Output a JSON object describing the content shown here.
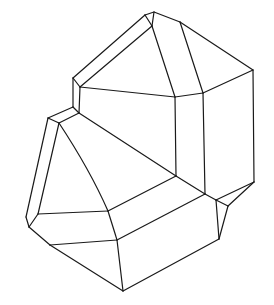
{
  "figure": {
    "title": "",
    "stroke_color": "#1a1a1a",
    "background": "#ffffff",
    "edges": [
      [
        145,
        15,
        154,
        12
      ],
      [
        154,
        12,
        180,
        22
      ],
      [
        180,
        22,
        253,
        70
      ],
      [
        145,
        15,
        73,
        78
      ],
      [
        152,
        26,
        80,
        87
      ],
      [
        145,
        15,
        152,
        26
      ],
      [
        154,
        12,
        152,
        26
      ],
      [
        73,
        78,
        80,
        87
      ],
      [
        80,
        87,
        175,
        97
      ],
      [
        152,
        26,
        175,
        97
      ],
      [
        180,
        22,
        203,
        93
      ],
      [
        175,
        97,
        203,
        93
      ],
      [
        203,
        93,
        253,
        70
      ],
      [
        73,
        78,
        73,
        107
      ],
      [
        80,
        87,
        79,
        113
      ],
      [
        73,
        107,
        79,
        113
      ],
      [
        175,
        97,
        176,
        176
      ],
      [
        203,
        93,
        205,
        194
      ],
      [
        253,
        70,
        254,
        182
      ],
      [
        73,
        107,
        48,
        118
      ],
      [
        79,
        113,
        59,
        123
      ],
      [
        48,
        118,
        59,
        123
      ],
      [
        79,
        113,
        176,
        176
      ],
      [
        176,
        176,
        205,
        194
      ],
      [
        205,
        194,
        216,
        200
      ],
      [
        216,
        200,
        228,
        206
      ],
      [
        228,
        206,
        254,
        182
      ],
      [
        216,
        200,
        254,
        182
      ],
      [
        216,
        200,
        219,
        239
      ],
      [
        228,
        206,
        219,
        239
      ],
      [
        48,
        118,
        26,
        217
      ],
      [
        59,
        123,
        38,
        214
      ],
      [
        26,
        217,
        29,
        227
      ],
      [
        38,
        214,
        29,
        227
      ],
      [
        38,
        214,
        108,
        211
      ],
      [
        176,
        176,
        108,
        211
      ],
      [
        29,
        227,
        50,
        245
      ],
      [
        50,
        245,
        117,
        240
      ],
      [
        108,
        211,
        117,
        240
      ],
      [
        117,
        240,
        205,
        194
      ],
      [
        50,
        245,
        123,
        291
      ],
      [
        117,
        240,
        123,
        291
      ],
      [
        123,
        291,
        219,
        239
      ]
    ],
    "curves": [
      "M59,123 Q90,170 108,211"
    ]
  }
}
